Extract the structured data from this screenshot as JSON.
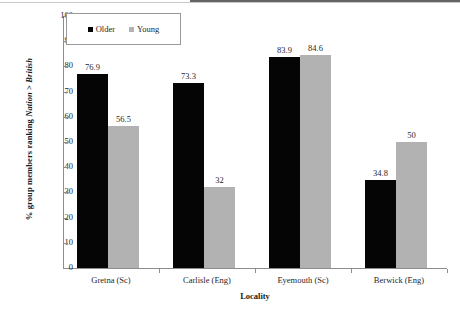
{
  "chart_data": {
    "type": "bar",
    "title": "",
    "xlabel": "Locality",
    "ylabel_parts": {
      "prefix": "% group members ranking ",
      "italic1": "Nation",
      "middle": " > ",
      "italic2": "British"
    },
    "ylabel": "% group members ranking Nation > British",
    "categories": [
      "Gretna (Sc)",
      "Carlisle (Eng)",
      "Eyemouth (Sc)",
      "Berwick (Eng)"
    ],
    "series": [
      {
        "name": "Older",
        "color": "#050505",
        "values": [
          76.9,
          73.3,
          83.9,
          34.8
        ],
        "labels": [
          "76.9",
          "73.3",
          "83.9",
          "34.8"
        ]
      },
      {
        "name": "Young",
        "color": "#b2b2b2",
        "values": [
          56.5,
          32,
          84.6,
          50
        ],
        "labels": [
          "56.5",
          "32",
          "84.6",
          "50"
        ]
      }
    ],
    "ylim": [
      0,
      100
    ],
    "yticks": [
      0,
      10,
      20,
      30,
      40,
      50,
      60,
      70,
      80,
      90,
      100
    ],
    "ytick_labels": [
      "0",
      "10",
      "20",
      "30",
      "40",
      "50",
      "60",
      "70",
      "80",
      "90",
      "100"
    ],
    "grid": false,
    "legend_position": "top-left"
  },
  "legend": {
    "items": [
      {
        "label": "Older",
        "swatch": "black-square-icon"
      },
      {
        "label": "Young",
        "swatch": "gray-square-icon"
      }
    ]
  }
}
